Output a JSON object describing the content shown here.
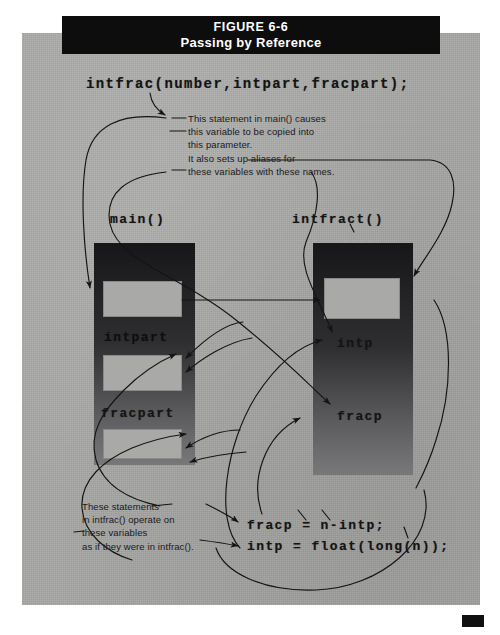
{
  "figure": {
    "number": "FIGURE 6-6",
    "title": "Passing by Reference"
  },
  "call_statement": "intfrac(number,intpart,fracpart);",
  "frames": {
    "left": {
      "label": "main()"
    },
    "right": {
      "label": "intfract()"
    }
  },
  "variables": {
    "left": [
      {
        "name": "intpart"
      },
      {
        "name": "fracpart"
      }
    ],
    "right": [
      {
        "name": "intp"
      },
      {
        "name": "fracp"
      }
    ]
  },
  "annotations": {
    "top": "This statement in main() causes\nthis variable to be copied into\nthis parameter.\nIt also sets up aliases for\nthese variables with these names.",
    "bottom": "These statements\nin intfrac() operate on\nthese variables\nas if they were in intfrac()."
  },
  "code_lines": [
    "fracp = n-intp;",
    "intp = float(long(n));"
  ],
  "colors": {
    "paper": "#a8a8a6",
    "banner": "#0d0d0d",
    "banner_text": "#ffffff",
    "block": "#17171a",
    "cell": "#a9a9a7",
    "ink": "#141414"
  }
}
